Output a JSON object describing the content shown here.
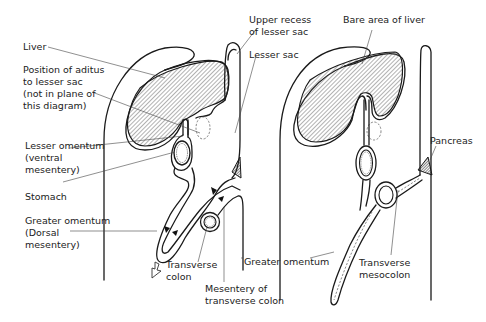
{
  "diagram": {
    "left_panel": {
      "labels": {
        "liver": "Liver",
        "aditus": "Position of aditus\nto lesser sac\n(not in plane of\nthis diagram)",
        "lesser_omentum": "Lesser omentum\n(ventral\nmesentery)",
        "stomach": "Stomach",
        "greater_omentum": "Greater omentum\n(Dorsal\nmesentery)",
        "transverse_colon": "Transverse\ncolon",
        "mesentery_transverse_colon": "Mesentery of\ntransverse colon",
        "upper_recess": "Upper recess\nof lesser sac",
        "lesser_sac": "Lesser sac",
        "greater_omentum_bottom": "Greater omentum"
      }
    },
    "right_panel": {
      "labels": {
        "bare_area": "Bare area of liver",
        "pancreas": "Pancreas",
        "transverse_mesocolon": "Transverse\nmesocolon"
      }
    },
    "colors": {
      "line": "#1a1a1a",
      "hatch": "#555555",
      "background": "#ffffff"
    }
  }
}
